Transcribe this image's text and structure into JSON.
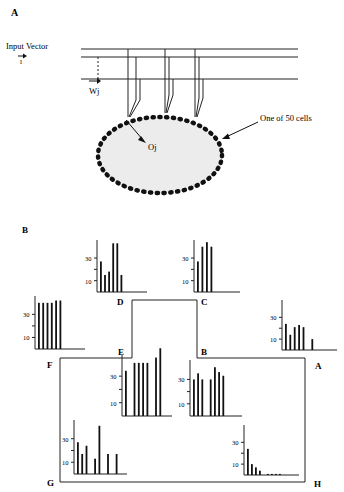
{
  "panel_a": {
    "label": "A",
    "input_vector_label": "Input Vector",
    "input_symbol": "I",
    "weight_label": "Wj",
    "output_label": "Oj",
    "cell_annotation": "One of 50 cells"
  },
  "panel_b": {
    "label": "B",
    "tick_30": "30",
    "tick_10": "10",
    "path_labels": [
      "A",
      "B",
      "C",
      "D",
      "E",
      "F",
      "G",
      "H"
    ]
  },
  "chart_data": [
    {
      "type": "bar",
      "title": "D",
      "ylim": [
        0,
        45
      ],
      "yticks": [
        10,
        30
      ],
      "values": [
        27,
        15,
        18,
        43,
        43,
        15
      ]
    },
    {
      "type": "bar",
      "title": "C",
      "ylim": [
        0,
        45
      ],
      "yticks": [
        10,
        30
      ],
      "values": [
        27,
        40,
        44,
        40
      ]
    },
    {
      "type": "bar",
      "title": "F",
      "ylim": [
        0,
        45
      ],
      "yticks": [
        10,
        30
      ],
      "values": [
        40,
        40,
        40,
        40,
        42,
        42
      ]
    },
    {
      "type": "bar",
      "title": "A",
      "ylim": [
        0,
        45
      ],
      "yticks": [
        10,
        30
      ],
      "values": [
        24,
        14,
        21,
        23,
        21,
        0,
        10
      ]
    },
    {
      "type": "bar",
      "title": "E",
      "ylim": [
        0,
        52
      ],
      "yticks": [
        10,
        30
      ],
      "values": [
        34,
        0,
        40,
        40,
        40,
        40,
        0,
        44,
        51
      ]
    },
    {
      "type": "bar",
      "title": "B",
      "ylim": [
        0,
        45
      ],
      "yticks": [
        10,
        30
      ],
      "values": [
        30,
        35,
        30,
        0,
        30,
        40,
        36,
        33
      ]
    },
    {
      "type": "bar",
      "title": "G",
      "ylim": [
        0,
        45
      ],
      "yticks": [
        10,
        30
      ],
      "values": [
        27,
        17,
        24,
        0,
        13,
        41,
        0,
        17,
        0,
        17
      ]
    },
    {
      "type": "bar",
      "title": "H",
      "ylim": [
        0,
        45
      ],
      "yticks": [
        10,
        30
      ],
      "values": [
        24,
        10,
        7,
        4,
        0,
        1,
        1,
        1,
        1
      ]
    }
  ]
}
